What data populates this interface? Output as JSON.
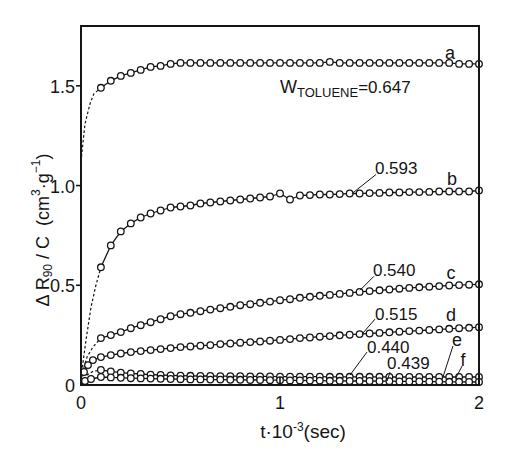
{
  "chart_data": {
    "type": "line",
    "title": "",
    "xlabel": "t·10⁻³(sec)",
    "ylabel": "ΔR90/C (cm³·g⁻¹)",
    "xlabel_parts": [
      "t·10",
      "-3",
      "(sec)"
    ],
    "ylabel_parts": [
      "Δ R",
      "90",
      " / C  (cm",
      "3",
      "·g",
      "−1",
      ")"
    ],
    "xlim": [
      0,
      2
    ],
    "ylim": [
      0,
      1.8
    ],
    "xticks": [
      0,
      1,
      2
    ],
    "xtick_labels": [
      "0",
      "1",
      "2"
    ],
    "yticks": [
      0,
      0.5,
      1.0,
      1.5
    ],
    "ytick_labels": [
      "0",
      "0.5",
      "1.0",
      "1.5"
    ],
    "grid": false,
    "legend": null,
    "composition_label": {
      "main": "W",
      "sub": "TOLUENE",
      "value": "=0.647",
      "x": 1.0,
      "y": 1.494
    },
    "x": [
      0.1,
      0.15,
      0.2,
      0.25,
      0.3,
      0.35,
      0.4,
      0.45,
      0.5,
      0.55,
      0.6,
      0.65,
      0.7,
      0.75,
      0.8,
      0.85,
      0.9,
      0.95,
      1.0,
      1.05,
      1.1,
      1.15,
      1.2,
      1.25,
      1.3,
      1.35,
      1.4,
      1.45,
      1.5,
      1.55,
      1.6,
      1.65,
      1.7,
      1.75,
      1.8,
      1.85,
      1.9,
      1.95,
      2.0
    ],
    "series": [
      {
        "name": "a",
        "w_toluene": "0.647",
        "y": [
          1.49,
          1.525,
          1.55,
          1.565,
          1.58,
          1.595,
          1.6,
          1.61,
          1.615,
          1.615,
          1.615,
          1.615,
          1.615,
          1.615,
          1.615,
          1.615,
          1.615,
          1.615,
          1.615,
          1.615,
          1.615,
          1.615,
          1.615,
          1.62,
          1.615,
          1.615,
          1.615,
          1.615,
          1.615,
          1.615,
          1.615,
          1.615,
          1.615,
          1.615,
          1.615,
          1.615,
          1.61,
          1.61,
          1.61
        ],
        "extrapolation": {
          "x": [
            0,
            0.02,
            0.045,
            0.065,
            0.1
          ],
          "y": [
            1.12,
            1.31,
            1.41,
            1.46,
            1.49
          ]
        }
      },
      {
        "name": "b",
        "w_toluene": "0.593",
        "y": [
          0.59,
          0.7,
          0.77,
          0.81,
          0.84,
          0.86,
          0.875,
          0.89,
          0.895,
          0.9,
          0.91,
          0.915,
          0.92,
          0.925,
          0.93,
          0.935,
          0.94,
          0.945,
          0.96,
          0.93,
          0.95,
          0.952,
          0.955,
          0.955,
          0.957,
          0.96,
          0.96,
          0.962,
          0.963,
          0.965,
          0.965,
          0.967,
          0.967,
          0.968,
          0.97,
          0.97,
          0.97,
          0.97,
          0.975
        ],
        "extrapolation": {
          "x": [
            0,
            0.025,
            0.05,
            0.075,
            0.1
          ],
          "y": [
            0.04,
            0.225,
            0.39,
            0.5,
            0.59
          ]
        }
      },
      {
        "name": "c",
        "w_toluene": "0.540",
        "y": [
          0.235,
          0.25,
          0.265,
          0.285,
          0.3,
          0.315,
          0.33,
          0.345,
          0.355,
          0.362,
          0.37,
          0.378,
          0.385,
          0.392,
          0.4,
          0.405,
          0.412,
          0.418,
          0.425,
          0.43,
          0.437,
          0.442,
          0.447,
          0.452,
          0.457,
          0.462,
          0.467,
          0.471,
          0.475,
          0.479,
          0.483,
          0.487,
          0.49,
          0.493,
          0.496,
          0.499,
          0.501,
          0.503,
          0.505
        ],
        "extrapolation": {
          "x": [
            0,
            0.03,
            0.06,
            0.1
          ],
          "y": [
            0.04,
            0.14,
            0.19,
            0.235
          ]
        }
      },
      {
        "name": "d",
        "w_toluene": "0.515",
        "x": [
          0.015,
          0.035,
          0.06,
          0.1,
          0.15,
          0.2,
          0.25,
          0.3,
          0.35,
          0.4,
          0.45,
          0.5,
          0.55,
          0.6,
          0.65,
          0.7,
          0.75,
          0.8,
          0.85,
          0.9,
          0.95,
          1.0,
          1.05,
          1.1,
          1.15,
          1.2,
          1.25,
          1.3,
          1.35,
          1.4,
          1.45,
          1.5,
          1.55,
          1.6,
          1.65,
          1.7,
          1.75,
          1.8,
          1.85,
          1.9,
          1.95,
          2.0
        ],
        "y": [
          0.065,
          0.1,
          0.125,
          0.14,
          0.15,
          0.158,
          0.165,
          0.17,
          0.175,
          0.18,
          0.185,
          0.19,
          0.193,
          0.197,
          0.2,
          0.205,
          0.208,
          0.212,
          0.215,
          0.218,
          0.222,
          0.226,
          0.23,
          0.235,
          0.238,
          0.242,
          0.245,
          0.249,
          0.252,
          0.255,
          0.258,
          0.261,
          0.264,
          0.267,
          0.27,
          0.273,
          0.276,
          0.279,
          0.282,
          0.285,
          0.287,
          0.29
        ],
        "extrapolation": {
          "x": [
            0,
            0.015
          ],
          "y": [
            0.02,
            0.065
          ]
        }
      },
      {
        "name": "e",
        "w_toluene": "0.440",
        "y": [
          0.075,
          0.068,
          0.062,
          0.058,
          0.055,
          0.052,
          0.05,
          0.048,
          0.047,
          0.046,
          0.045,
          0.045,
          0.044,
          0.044,
          0.044,
          0.043,
          0.043,
          0.043,
          0.042,
          0.042,
          0.042,
          0.042,
          0.042,
          0.041,
          0.041,
          0.041,
          0.041,
          0.041,
          0.041,
          0.04,
          0.04,
          0.04,
          0.04,
          0.04,
          0.04,
          0.04,
          0.04,
          0.04,
          0.04
        ],
        "extrapolation": {
          "x": [
            0,
            0.03,
            0.06,
            0.1
          ],
          "y": [
            0.01,
            0.05,
            0.068,
            0.075
          ]
        }
      },
      {
        "name": "f",
        "w_toluene": "0.439",
        "x": [
          0.02,
          0.05,
          0.1,
          0.15,
          0.2,
          0.25,
          0.3,
          0.35,
          0.4,
          0.45,
          0.5,
          0.55,
          0.6,
          0.65,
          0.7,
          0.75,
          0.8,
          0.85,
          0.9,
          0.95,
          1.0,
          1.05,
          1.1,
          1.15,
          1.2,
          1.25,
          1.3,
          1.35,
          1.4,
          1.45,
          1.5,
          1.55,
          1.6,
          1.65,
          1.7,
          1.75,
          1.8,
          1.85,
          1.9,
          1.95,
          2.0
        ],
        "y": [
          0.02,
          0.03,
          0.04,
          0.038,
          0.036,
          0.034,
          0.033,
          0.032,
          0.031,
          0.03,
          0.029,
          0.028,
          0.028,
          0.027,
          0.027,
          0.026,
          0.026,
          0.025,
          0.025,
          0.024,
          0.024,
          0.023,
          0.023,
          0.022,
          0.022,
          0.021,
          0.021,
          0.02,
          0.02,
          0.02,
          0.019,
          0.019,
          0.018,
          0.018,
          0.018,
          0.017,
          0.017,
          0.016,
          0.016,
          0.015,
          0.015
        ],
        "extrapolation": {
          "x": [
            0,
            0.02
          ],
          "y": [
            0.005,
            0.02
          ]
        }
      }
    ],
    "annotations": [
      {
        "text": "a",
        "x": 1.854,
        "y": 1.665
      },
      {
        "text": "b",
        "x": 1.864,
        "y": 1.035
      },
      {
        "text": "c",
        "x": 1.859,
        "y": 0.56
      },
      {
        "text": "d",
        "x": 1.859,
        "y": 0.35
      },
      {
        "text": "e",
        "x": 1.889,
        "y": 0.225,
        "leader": [
          [
            1.869,
            0.195
          ],
          [
            1.819,
            0.04
          ]
        ]
      },
      {
        "text": "f",
        "x": 1.92,
        "y": 0.125,
        "leader": [
          [
            1.915,
            0.095
          ],
          [
            1.884,
            0.035
          ]
        ]
      },
      {
        "text": "0.593",
        "x": 1.477,
        "y": 1.085,
        "leader": [
          [
            1.482,
            1.055
          ],
          [
            1.362,
            0.96
          ]
        ]
      },
      {
        "text": "0.540",
        "x": 1.467,
        "y": 0.575,
        "leader": [
          [
            1.472,
            0.545
          ],
          [
            1.402,
            0.475
          ]
        ]
      },
      {
        "text": "0.515",
        "x": 1.477,
        "y": 0.355,
        "leader": [
          [
            1.477,
            0.33
          ],
          [
            1.412,
            0.255
          ]
        ]
      },
      {
        "text": "0.440",
        "x": 1.437,
        "y": 0.19,
        "leader": [
          [
            1.437,
            0.165
          ],
          [
            1.352,
            0.05
          ]
        ]
      },
      {
        "text": "0.439",
        "x": 1.538,
        "y": 0.11,
        "leader": [
          [
            1.553,
            0.065
          ],
          [
            1.538,
            0.02
          ]
        ]
      }
    ]
  }
}
